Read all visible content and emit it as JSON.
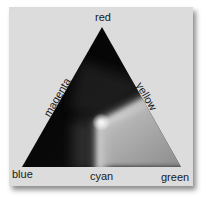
{
  "diagram": {
    "type": "ternary-color-triangle",
    "vertices": {
      "top": "red",
      "bottom_left": "blue",
      "bottom_right": "green"
    },
    "edges": {
      "left": "magenta",
      "right": "yellow",
      "bottom": "cyan"
    },
    "colors": {
      "panel_background": "#dcdcdc",
      "triangle_dark": "#000000",
      "ridge_highlight": "#f4f4f4",
      "lower_right_fill": "#9a9a9a",
      "label_text": "#1a1a1a"
    }
  }
}
